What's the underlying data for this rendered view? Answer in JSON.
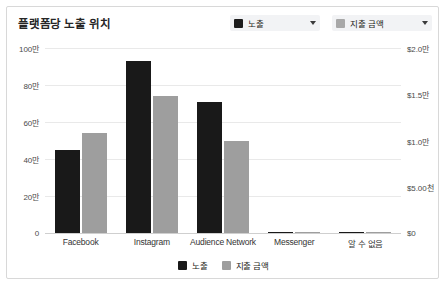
{
  "card": {
    "title": "플랫폼당 노출 위치"
  },
  "series_selectors": [
    {
      "label": "노출",
      "swatch": "#1c1c1c",
      "caret_icon": "chevron-down-icon"
    },
    {
      "label": "지출 금액",
      "swatch": "#a8a8a8",
      "caret_icon": "chevron-down-icon"
    }
  ],
  "legend": [
    {
      "label": "노출",
      "color": "#191919"
    },
    {
      "label": "지출 금액",
      "color": "#9e9e9e"
    }
  ],
  "chart_data": {
    "type": "bar",
    "title": "플랫폼당 노출 위치",
    "xlabel": "",
    "ylabel": "",
    "grid": true,
    "legend_position": "bottom",
    "categories": [
      "Facebook",
      "Instagram",
      "Audience Network",
      "Messenger",
      "알 수 없음"
    ],
    "series": [
      {
        "name": "노출",
        "axis": "left",
        "color": "#191919",
        "values": [
          450000,
          930000,
          710000,
          8000,
          6000
        ]
      },
      {
        "name": "지출 금액",
        "axis": "right",
        "color": "#9e9e9e",
        "values": [
          10800,
          14800,
          9950,
          90,
          70
        ]
      }
    ],
    "y_left": {
      "ylim": [
        0,
        1000000
      ],
      "ticks": [
        0,
        200000,
        400000,
        600000,
        800000,
        1000000
      ],
      "tick_labels": [
        "0",
        "20만",
        "40만",
        "60만",
        "80만",
        "100만"
      ]
    },
    "y_right": {
      "ylim": [
        0,
        20000
      ],
      "ticks": [
        0,
        5000,
        10000,
        15000,
        20000
      ],
      "tick_labels": [
        "$0",
        "$5.00천",
        "$1.0만",
        "$1.5만",
        "$2.0만"
      ]
    }
  }
}
